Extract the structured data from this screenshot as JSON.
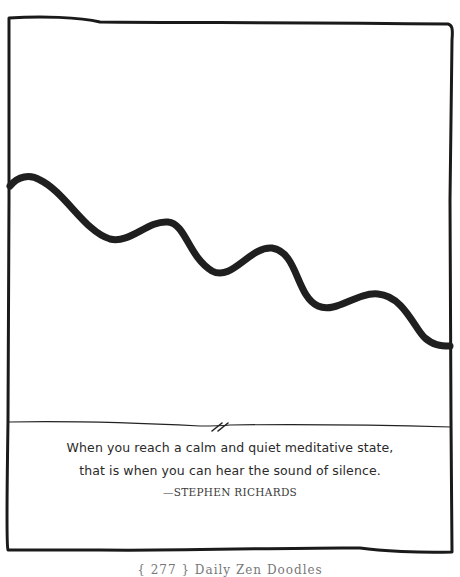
{
  "illustration": {
    "description": "Hand-drawn frame containing a thick wavy line descending from left to right, with a divider line and break mark above a quote",
    "frame_color": "#1a1a1a",
    "line_color": "#1f1f1f"
  },
  "quote": {
    "line1": "When you reach a calm and quiet meditative state,",
    "line2": "that is when you can hear the sound of silence.",
    "attribution": "—STEPHEN RICHARDS"
  },
  "footer": {
    "text": "{ 277 } Daily Zen Doodles"
  }
}
